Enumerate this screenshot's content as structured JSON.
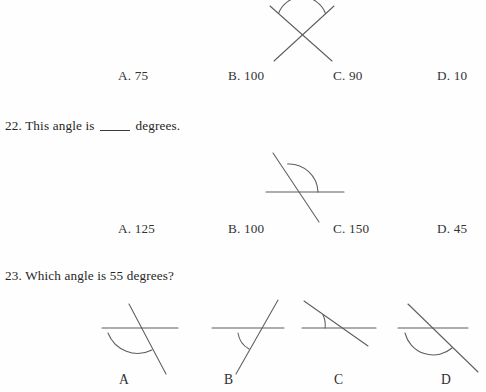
{
  "document": {
    "kind": "math-worksheet-scan",
    "ink_color": "#5d5d61",
    "text_color": "#262626",
    "background": "#fefefe"
  },
  "question_21_choices": {
    "label": "answer-choices-row-21",
    "items": [
      {
        "key": "A.",
        "value": "75",
        "text": "A. 75"
      },
      {
        "key": "B.",
        "value": "100",
        "text": "B. 100"
      },
      {
        "key": "C.",
        "value": "90",
        "text": "C. 90"
      },
      {
        "key": "D.",
        "value": "10",
        "text": "D. 10"
      }
    ]
  },
  "question_22": {
    "number": "22.",
    "prefix": "22. This angle is",
    "suffix": "degrees.",
    "blank": "____",
    "full_text": "22. This angle is ____ degrees.",
    "choices": [
      {
        "key": "A.",
        "value": "125",
        "text": "A. 125"
      },
      {
        "key": "B.",
        "value": "100",
        "text": "B. 100"
      },
      {
        "key": "C.",
        "value": "150",
        "text": "C. 150"
      },
      {
        "key": "D.",
        "value": "45",
        "text": "D. 45"
      }
    ]
  },
  "question_23": {
    "number": "23.",
    "full_text": "23. Which angle is 55 degrees?",
    "target_degrees": "55",
    "figure_labels": [
      {
        "text": "A"
      },
      {
        "text": "B"
      },
      {
        "text": "C"
      },
      {
        "text": "D"
      }
    ]
  },
  "figures": {
    "top_crossed_lines": {
      "name": "angle-diagram-crossed-x",
      "description": "two straight lines crossing forming an X, arc marks the upper vertical angle",
      "arc_marks": "upper-angle"
    },
    "middle_transversal": {
      "name": "angle-diagram-transversal",
      "description": "horizontal line crossed by a diagonal line descending left-to-right, large arc marks the obtuse angle above the horizontal on the right",
      "arc_marks": "obtuse-upper-right"
    },
    "choice_a": {
      "name": "angle-diagram-choice-a",
      "description": "horizontal line crossed by steep diagonal descending left-to-right, large arc below-left marking the obtuse angle"
    },
    "choice_b": {
      "name": "angle-diagram-choice-b",
      "description": "horizontal line crossed by diagonal rising left-to-right, arc below-left marking the acute angle"
    },
    "choice_c": {
      "name": "angle-diagram-choice-c",
      "description": "horizontal line crossed by shallow diagonal descending left-to-right, small arc above-left marking the acute angle"
    },
    "choice_d": {
      "name": "angle-diagram-choice-d",
      "description": "horizontal line crossed by diagonal descending left-to-right, large arc below marking the obtuse angle"
    }
  }
}
